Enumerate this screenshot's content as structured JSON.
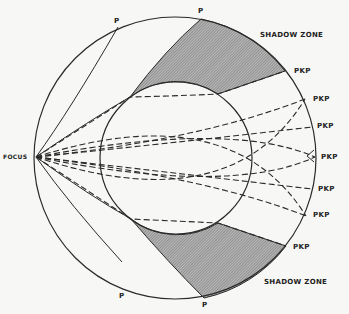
{
  "diagram": {
    "colors": {
      "line": "#2a2a2a",
      "shading": "#8f8f8f",
      "background": "#f7f7f5"
    },
    "labels": {
      "focus": "FOCUS",
      "p_top_left": "P",
      "p_top_right": "P",
      "p_bottom_left": "P",
      "p_bottom_right": "P",
      "shadow_zone_top": "SHADOW ZONE",
      "shadow_zone_bottom": "SHADOW ZONE",
      "pkp": [
        "PKP",
        "PKP",
        "PKP",
        "PKP",
        "PKP",
        "PKP",
        "PKP"
      ]
    },
    "elements": {
      "outer_circle": "mantle / Earth surface",
      "inner_circle": "core",
      "shaded_regions": [
        "shadow zone top",
        "shadow zone bottom"
      ],
      "solid_rays": "P wave paths",
      "dashed_rays": "PKP wave paths through core"
    }
  }
}
